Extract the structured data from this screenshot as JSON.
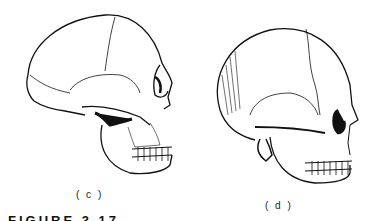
{
  "figure": {
    "panels": [
      {
        "label": "( c )",
        "subject": "skull-lateral-view-archaic"
      },
      {
        "label": "( d )",
        "subject": "skull-lateral-view-modern"
      }
    ],
    "caption": "FIGURE 3.17"
  }
}
